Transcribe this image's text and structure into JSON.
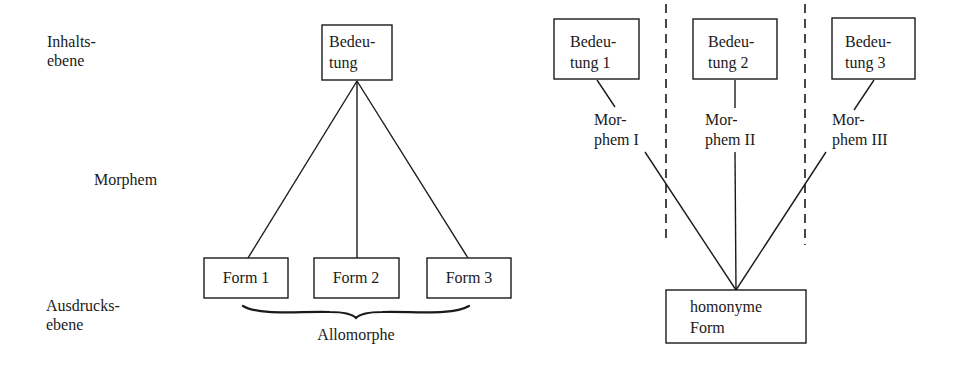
{
  "left_diagram": {
    "title": "Allomorphie",
    "level_labels": {
      "content_level": [
        "Inhalts-",
        "ebene"
      ],
      "morpheme": "Morphem",
      "expression_level": [
        "Ausdrucks-",
        "ebene"
      ]
    },
    "meaning_box": {
      "lines": [
        "Bedeu-",
        "tung"
      ]
    },
    "form_boxes": [
      {
        "label": "Form 1"
      },
      {
        "label": "Form 2"
      },
      {
        "label": "Form 3"
      }
    ],
    "brace_label": "Allomorphe"
  },
  "right_diagram": {
    "title": "Homonymie",
    "meaning_boxes": [
      {
        "lines": [
          "Bedeu-",
          "tung 1"
        ]
      },
      {
        "lines": [
          "Bedeu-",
          "tung 2"
        ]
      },
      {
        "lines": [
          "Bedeu-",
          "tung 3"
        ]
      }
    ],
    "morpheme_labels": [
      {
        "lines": [
          "Mor-",
          "phem I"
        ]
      },
      {
        "lines": [
          "Mor-",
          "phem II"
        ]
      },
      {
        "lines": [
          "Mor-",
          "phem III"
        ]
      }
    ],
    "form_box": {
      "lines": [
        "homonyme",
        "Form"
      ]
    }
  },
  "colors": {
    "ink": "#1a1a1a",
    "background": "#ffffff"
  }
}
